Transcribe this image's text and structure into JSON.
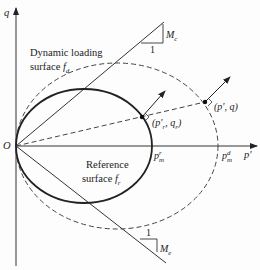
{
  "diagram": {
    "axes": {
      "y_label": "q",
      "x_label": "p'",
      "origin_label": "O"
    },
    "surfaces": {
      "dynamic": {
        "label_line1": "Dynamic loading",
        "label_line2": "surface ",
        "symbol": "f",
        "subscript": "d",
        "style": "dashed"
      },
      "reference": {
        "label_line1": "Reference",
        "label_line2": "surface ",
        "symbol": "f",
        "subscript": "r",
        "style": "solid"
      }
    },
    "points": {
      "reference_point": {
        "label": "(p'",
        "sub": "r",
        "rest": ", q",
        "sub2": "r",
        "close": ")"
      },
      "current_point": {
        "label": "(p', q)"
      }
    },
    "axis_marks": {
      "pm_r": {
        "base": "p",
        "sup": "r",
        "sub": "m"
      },
      "pm_d": {
        "base": "p",
        "sup": "d",
        "sub": "m"
      }
    },
    "slopes": {
      "compression": {
        "run": "1",
        "rise_base": "M",
        "rise_sub": "c"
      },
      "extension": {
        "run": "1",
        "rise_base": "M",
        "rise_sub": "e"
      }
    },
    "colors": {
      "line": "#2a2a2a",
      "background": "#fdfdfd"
    }
  }
}
